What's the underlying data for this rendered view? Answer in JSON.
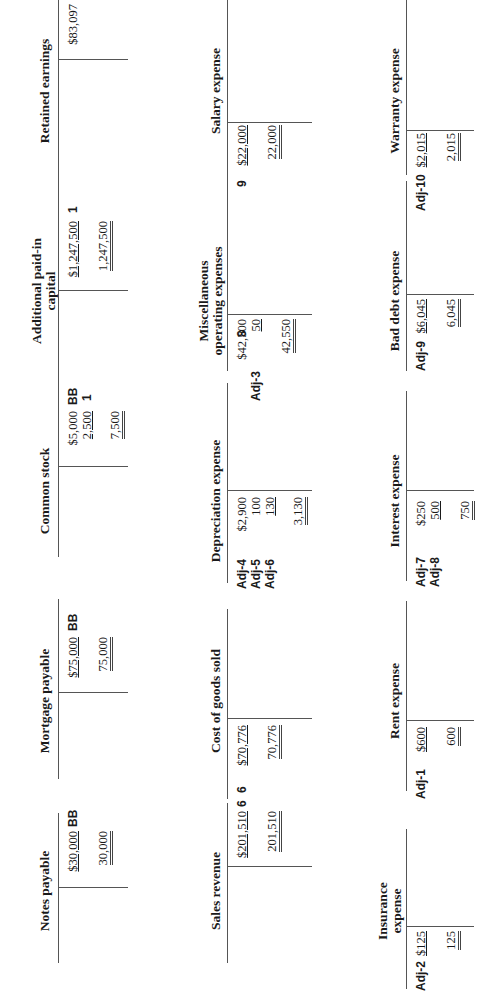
{
  "rows": [
    {
      "accounts": [
        {
          "name": "Notes payable",
          "credit": [
            {
              "amount": "$30,000",
              "ref": "BB",
              "underline": true
            }
          ],
          "credit_total": "30,000"
        },
        {
          "name": "Mortgage payable",
          "credit": [
            {
              "amount": "$75,000",
              "ref": "BB",
              "underline": true
            }
          ],
          "credit_total": "75,000"
        },
        {
          "name": "Common stock",
          "credit": [
            {
              "amount": "$5,000",
              "ref": "BB",
              "underline": false
            },
            {
              "amount": "2,500",
              "ref": "1",
              "underline": true
            }
          ],
          "credit_total": "7,500"
        },
        {
          "name": "Additional paid-in capital",
          "name_line1": "Additional paid-in",
          "name_line2": "capital",
          "credit": [
            {
              "amount": "$1,247,500",
              "ref": "1",
              "underline": true
            }
          ],
          "credit_total": "1,247,500"
        },
        {
          "name": "Retained earnings",
          "credit": [
            {
              "amount": "$83,097",
              "ref": "BB",
              "underline": false
            }
          ]
        }
      ]
    },
    {
      "accounts": [
        {
          "name": "Sales revenue",
          "credit": [
            {
              "amount": "$201,510",
              "ref": "6",
              "underline": true
            }
          ],
          "credit_total": "201,510"
        },
        {
          "name": "Cost of goods sold",
          "debit": [
            {
              "ref": "6",
              "amount": "$70,776",
              "underline": true
            }
          ],
          "debit_total": "70,776"
        },
        {
          "name": "Depreciation expense",
          "debit": [
            {
              "ref": "Adj-4",
              "amount": "$2,900",
              "underline": false
            },
            {
              "ref": "Adj-5",
              "amount": "100",
              "underline": false
            },
            {
              "ref": "Adj-6",
              "amount": "130",
              "underline": true
            }
          ],
          "debit_total": "3,130"
        },
        {
          "name": "Miscellaneous operating expenses",
          "name_line1": "Miscellaneous",
          "name_line2": "operating expenses",
          "debit": [
            {
              "ref": "8",
              "amount": "$42,500",
              "underline": false
            },
            {
              "ref": "Adj-3",
              "amount": "50",
              "underline": true
            }
          ],
          "debit_total": "42,550"
        },
        {
          "name": "Salary expense",
          "debit": [
            {
              "ref": "9",
              "amount": "$22,000",
              "underline": true
            }
          ],
          "debit_total": "22,000"
        }
      ]
    },
    {
      "accounts": [
        {
          "name": "Insurance expense",
          "name_line1": "Insurance",
          "name_line2": "expense",
          "debit": [
            {
              "ref": "Adj-2",
              "amount": "$125",
              "underline": true
            }
          ],
          "debit_total": "125"
        },
        {
          "name": "Rent expense",
          "debit": [
            {
              "ref": "Adj-1",
              "amount": "$600",
              "underline": true
            }
          ],
          "debit_total": "600"
        },
        {
          "name": "Interest expense",
          "debit": [
            {
              "ref": "Adj-7",
              "amount": "$250",
              "underline": false
            },
            {
              "ref": "Adj-8",
              "amount": "500",
              "underline": true
            }
          ],
          "debit_total": "750"
        },
        {
          "name": "Bad debt expense",
          "debit": [
            {
              "ref": "Adj-9",
              "amount": "$6,045",
              "underline": true
            }
          ],
          "debit_total": "6,045"
        },
        {
          "name": "Warranty expense",
          "debit": [
            {
              "ref": "Adj-10",
              "amount": "$2,015",
              "underline": true
            }
          ],
          "debit_total": "2,015"
        }
      ]
    }
  ]
}
